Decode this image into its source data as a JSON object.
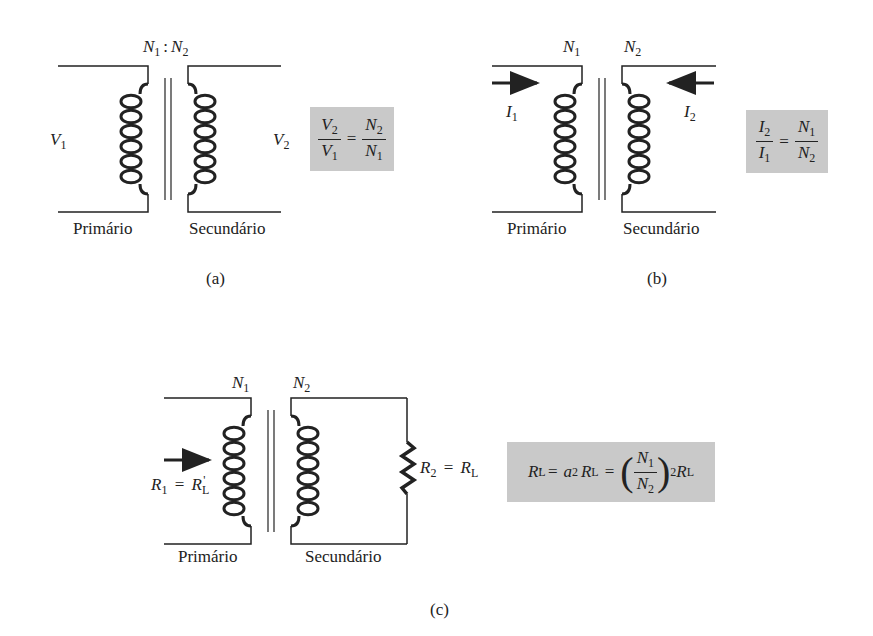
{
  "figure_a": {
    "turns_label": {
      "n1": "N",
      "n1_sub": "1",
      "sep": ":",
      "n2": "N",
      "n2_sub": "2"
    },
    "v1": {
      "sym": "V",
      "sub": "1"
    },
    "v2": {
      "sym": "V",
      "sub": "2"
    },
    "primary_label": "Primário",
    "secondary_label": "Secundário",
    "formula": {
      "lhs_num": "V",
      "lhs_num_sub": "2",
      "lhs_den": "V",
      "lhs_den_sub": "1",
      "eq": "=",
      "rhs_num": "N",
      "rhs_num_sub": "2",
      "rhs_den": "N",
      "rhs_den_sub": "1"
    },
    "caption": "(a)"
  },
  "figure_b": {
    "n1": {
      "sym": "N",
      "sub": "1"
    },
    "n2": {
      "sym": "N",
      "sub": "2"
    },
    "i1": {
      "sym": "I",
      "sub": "1"
    },
    "i2": {
      "sym": "I",
      "sub": "2"
    },
    "primary_label": "Primário",
    "secondary_label": "Secundário",
    "formula": {
      "lhs_num": "I",
      "lhs_num_sub": "2",
      "lhs_den": "I",
      "lhs_den_sub": "1",
      "eq": "=",
      "rhs_num": "N",
      "rhs_num_sub": "1",
      "rhs_den": "N",
      "rhs_den_sub": "2"
    },
    "caption": "(b)"
  },
  "figure_c": {
    "n1": {
      "sym": "N",
      "sub": "1"
    },
    "n2": {
      "sym": "N",
      "sub": "2"
    },
    "r1": {
      "sym": "R",
      "sub": "1",
      "eq": "=",
      "rhs": "R",
      "rhs_sub": "L",
      "prime": "'"
    },
    "r2": {
      "sym": "R",
      "sub": "2",
      "eq": "=",
      "rhs": "R",
      "rhs_sub": "L"
    },
    "primary_label": "Primário",
    "secondary_label": "Secundário",
    "formula": {
      "lhs": "R",
      "lhs_sub": "L",
      "prime": "'",
      "eq1": "=",
      "a": "a",
      "a_sup": "2",
      "rl": "R",
      "rl_sub": "L",
      "eq2": "=",
      "lparen": "(",
      "num": "N",
      "num_sub": "1",
      "den": "N",
      "den_sub": "2",
      "rparen": ")",
      "pow": "2",
      "rl2": "R",
      "rl2_sub": "L"
    },
    "caption": "(c)"
  }
}
